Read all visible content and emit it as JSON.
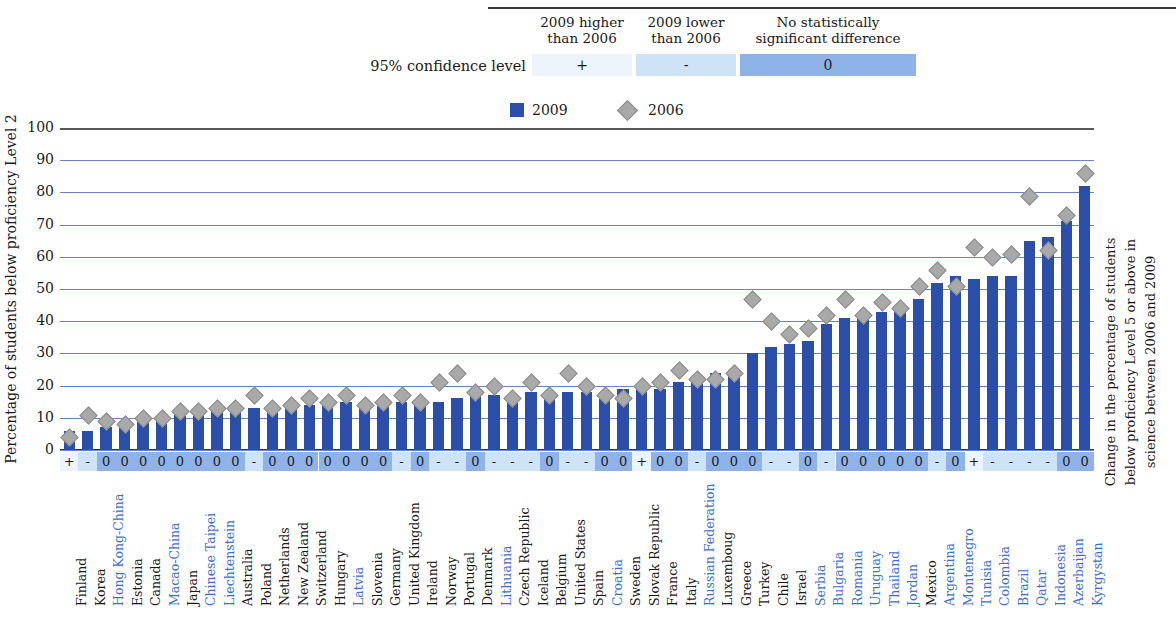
{
  "significance_legend": {
    "row_label": "95% confidence level",
    "headers": [
      "2009 higher\nthan 2006",
      "2009 lower\nthan 2006",
      "No statistically\nsignificant difference"
    ],
    "header_1_line1": "2009 higher",
    "header_1_line2": "than 2006",
    "header_2_line1": "2009 lower",
    "header_2_line2": "than 2006",
    "header_3_line1": "No statistically",
    "header_3_line2": "significant difference",
    "symbols": [
      "+",
      "-",
      "0"
    ],
    "colors": {
      "plus": "#eef4fc",
      "minus": "#cfe3f7",
      "zero": "#8fb3e8"
    }
  },
  "series_legend": {
    "items": [
      {
        "label": "2009",
        "marker": "square",
        "color": "#2b4fa8"
      },
      {
        "label": "2006",
        "marker": "diamond",
        "color": "#a9a9a9"
      }
    ]
  },
  "axis_titles": {
    "left": "Percentage of students below proficiency Level 2",
    "right_line1": "Change in the percentage of students",
    "right_line2": "below proficiency Level 5 or above in",
    "right_line3": "science between 2006 and 2009"
  },
  "chart_data": {
    "type": "bar",
    "title": "",
    "xlabel": "",
    "ylabel": "Percentage of students below proficiency Level 2",
    "ylim": [
      0,
      100
    ],
    "yticks": [
      0,
      10,
      20,
      30,
      40,
      50,
      60,
      70,
      80,
      90,
      100
    ],
    "grid": true,
    "legend_position": "top",
    "categories": [
      "Finland",
      "Korea",
      "Hong Kong-China",
      "Estonia",
      "Canada",
      "Macao-China",
      "Japan",
      "Chinese Taipei",
      "Liechtenstein",
      "Australia",
      "Poland",
      "Netherlands",
      "New Zealand",
      "Switzerland",
      "Hungary",
      "Latvia",
      "Slovenia",
      "Germany",
      "United Kingdom",
      "Ireland",
      "Norway",
      "Portugal",
      "Denmark",
      "Lithuania",
      "Czech Republic",
      "Iceland",
      "Belgium",
      "United States",
      "Spain",
      "Croatia",
      "Sweden",
      "Slovak Republic",
      "France",
      "Italy",
      "Russian Federation",
      "Luxemboug",
      "Greece",
      "Turkey",
      "Chile",
      "Israel",
      "Serbia",
      "Bulgaria",
      "Romania",
      "Uruguay",
      "Thailand",
      "Jordan",
      "Mexico",
      "Argentina",
      "Montenegro",
      "Tunisia",
      "Colombia",
      "Brazil",
      "Qatar",
      "Indonesia",
      "Azerbaijan",
      "Kyrgystan"
    ],
    "partner_flags": [
      false,
      false,
      true,
      false,
      false,
      true,
      false,
      true,
      true,
      false,
      false,
      false,
      false,
      false,
      false,
      true,
      false,
      false,
      false,
      false,
      false,
      false,
      false,
      true,
      false,
      false,
      false,
      false,
      false,
      true,
      false,
      false,
      false,
      false,
      true,
      false,
      false,
      false,
      false,
      false,
      true,
      true,
      true,
      true,
      true,
      true,
      false,
      true,
      true,
      true,
      true,
      true,
      true,
      true,
      true,
      true
    ],
    "series": [
      {
        "name": "2009",
        "marker": "bar",
        "color": "#2b4fa8",
        "values": [
          6,
          6,
          7,
          8,
          9,
          10,
          11,
          11,
          12,
          13,
          13,
          13,
          13,
          14,
          14,
          15,
          15,
          15,
          15,
          15,
          15,
          16,
          17,
          17,
          17,
          18,
          18,
          18,
          18,
          18,
          19,
          19,
          19,
          21,
          22,
          24,
          25,
          30,
          32,
          33,
          34,
          39,
          41,
          42,
          43,
          45,
          47,
          52,
          54,
          53,
          54,
          54,
          65,
          66,
          71,
          82
        ]
      },
      {
        "name": "2006",
        "marker": "diamond",
        "color": "#a9a9a9",
        "values": [
          4,
          11,
          9,
          8,
          10,
          10,
          12,
          12,
          13,
          13,
          17,
          13,
          14,
          16,
          15,
          17,
          14,
          15,
          17,
          15,
          21,
          24,
          18,
          20,
          16,
          21,
          17,
          24,
          20,
          17,
          16,
          20,
          21,
          25,
          22,
          22,
          24,
          47,
          40,
          36,
          38,
          42,
          47,
          42,
          46,
          44,
          51,
          56,
          51,
          63,
          60,
          61,
          79,
          62,
          73,
          86
        ]
      }
    ],
    "significance": [
      "+",
      "-",
      "0",
      "0",
      "0",
      "0",
      "0",
      "0",
      "0",
      "0",
      "-",
      "0",
      "0",
      "0",
      "0",
      "0",
      "0",
      "0",
      "-",
      "0",
      "-",
      "-",
      "0",
      "-",
      "-",
      "-",
      "0",
      "-",
      "-",
      "0",
      "0",
      "+",
      "0",
      "0",
      "-",
      "0",
      "0",
      "0",
      "-",
      "-",
      "0",
      "-",
      "0",
      "0",
      "0",
      "0",
      "0",
      "-",
      "0",
      "+",
      "-",
      "-",
      "-",
      "-",
      "0",
      "0",
      "-"
    ]
  }
}
